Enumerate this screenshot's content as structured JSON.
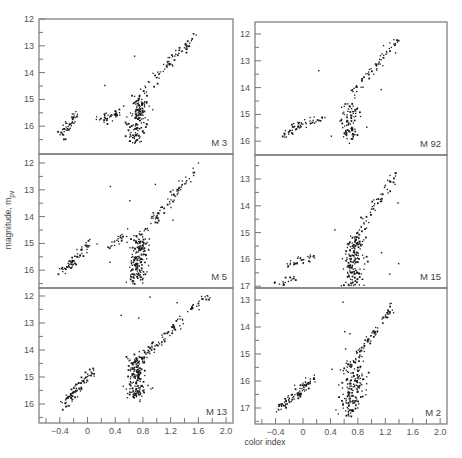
{
  "figure": {
    "ylabel": "magnitude, m_pv",
    "ylabel_main": "magnitude, m",
    "ylabel_sub": "pv",
    "xlabel": "color index",
    "x_ticks": [
      "-0.4",
      "0",
      "0.4",
      "0.8",
      "1.2",
      "1.6",
      "2.0"
    ],
    "colors": {
      "frame": "#777777",
      "points": "#1a1a1a",
      "text": "#555555"
    }
  },
  "chart_data": [
    {
      "type": "scatter",
      "title": "M 3",
      "xlabel": "",
      "ylabel": "magnitude, m_pv",
      "xlim": [
        -0.7,
        2.1
      ],
      "ylim": [
        16.65,
        12
      ],
      "y_ticks": [
        "12",
        "13",
        "14",
        "15",
        "16"
      ],
      "clusters": [
        {
          "region": "horizontal branch (blue)",
          "x": [
            -0.4,
            -0.15
          ],
          "y": [
            16.3,
            15.5
          ],
          "n": 45
        },
        {
          "region": "horizontal branch (red)",
          "x": [
            0.15,
            0.45
          ],
          "y": [
            15.7,
            15.45
          ],
          "n": 35
        },
        {
          "region": "main sequence turnoff/subgiant",
          "x": [
            0.55,
            0.85
          ],
          "y": [
            16.5,
            15.0
          ],
          "n": 150
        },
        {
          "region": "red giant branch",
          "x": [
            0.7,
            1.55
          ],
          "y": [
            15.0,
            12.5
          ],
          "n": 70
        }
      ]
    },
    {
      "type": "scatter",
      "title": "M 92",
      "xlim": [
        -0.7,
        2.1
      ],
      "ylim": [
        16.5,
        11.7
      ],
      "y_ticks": [
        "12",
        "13",
        "14",
        "15",
        "16"
      ],
      "clusters": [
        {
          "region": "horizontal branch (blue)",
          "x": [
            -0.3,
            0.05
          ],
          "y": [
            15.8,
            15.2
          ],
          "n": 45
        },
        {
          "region": "horizontal branch (red)",
          "x": [
            0.1,
            0.35
          ],
          "y": [
            15.2,
            15.1
          ],
          "n": 15
        },
        {
          "region": "main sequence turnoff/subgiant",
          "x": [
            0.5,
            0.8
          ],
          "y": [
            15.9,
            14.5
          ],
          "n": 90
        },
        {
          "region": "red giant branch",
          "x": [
            0.6,
            1.4
          ],
          "y": [
            14.5,
            12.1
          ],
          "n": 60
        }
      ]
    },
    {
      "type": "scatter",
      "title": "M 5",
      "xlim": [
        -0.7,
        2.1
      ],
      "ylim": [
        16.5,
        11.6
      ],
      "y_ticks": [
        "12",
        "13",
        "14",
        "15",
        "16"
      ],
      "clusters": [
        {
          "region": "horizontal branch (blue)",
          "x": [
            -0.35,
            0.05
          ],
          "y": [
            16.0,
            14.9
          ],
          "n": 60
        },
        {
          "region": "horizontal branch (red)",
          "x": [
            0.3,
            0.55
          ],
          "y": [
            15.1,
            14.5
          ],
          "n": 25
        },
        {
          "region": "main sequence turnoff/subgiant",
          "x": [
            0.55,
            0.85
          ],
          "y": [
            16.4,
            14.8
          ],
          "n": 170
        },
        {
          "region": "red giant branch",
          "x": [
            0.7,
            1.6
          ],
          "y": [
            14.8,
            12.1
          ],
          "n": 80
        }
      ]
    },
    {
      "type": "scatter",
      "title": "M 15",
      "xlim": [
        -0.7,
        2.1
      ],
      "ylim": [
        17.2,
        12.2
      ],
      "y_ticks": [
        "13",
        "14",
        "15",
        "16",
        "17"
      ],
      "clusters": [
        {
          "region": "horizontal branch (blue)",
          "x": [
            -0.2,
            0.15
          ],
          "y": [
            16.1,
            15.9
          ],
          "n": 30
        },
        {
          "region": "horizontal branch (blue tail)",
          "x": [
            -0.4,
            -0.1
          ],
          "y": [
            17.1,
            16.5
          ],
          "n": 20
        },
        {
          "region": "main sequence turnoff/subgiant",
          "x": [
            0.55,
            0.85
          ],
          "y": [
            17.1,
            15.2
          ],
          "n": 170
        },
        {
          "region": "red giant branch",
          "x": [
            0.75,
            1.35
          ],
          "y": [
            15.2,
            12.7
          ],
          "n": 60
        }
      ]
    },
    {
      "type": "scatter",
      "title": "M 13",
      "xlim": [
        -0.7,
        2.1
      ],
      "ylim": [
        16.5,
        11.6
      ],
      "y_ticks": [
        "12",
        "13",
        "14",
        "15",
        "16"
      ],
      "clusters": [
        {
          "region": "horizontal branch (blue)",
          "x": [
            -0.35,
            0.05
          ],
          "y": [
            16.0,
            14.7
          ],
          "n": 80
        },
        {
          "region": "main sequence turnoff/subgiant",
          "x": [
            0.5,
            0.85
          ],
          "y": [
            15.8,
            14.2
          ],
          "n": 170
        },
        {
          "region": "red giant branch",
          "x": [
            0.7,
            1.75
          ],
          "y": [
            14.5,
            11.8
          ],
          "n": 90
        }
      ]
    },
    {
      "type": "scatter",
      "title": "M 2",
      "xlim": [
        -0.7,
        2.1
      ],
      "ylim": [
        17.5,
        12.5
      ],
      "y_ticks": [
        "13",
        "14",
        "15",
        "16",
        "17"
      ],
      "clusters": [
        {
          "region": "horizontal branch (blue)",
          "x": [
            -0.35,
            0.15
          ],
          "y": [
            17.0,
            15.9
          ],
          "n": 90
        },
        {
          "region": "main sequence turnoff/subgiant",
          "x": [
            0.45,
            0.9
          ],
          "y": [
            17.3,
            15.2
          ],
          "n": 170
        },
        {
          "region": "red giant branch",
          "x": [
            0.7,
            1.3
          ],
          "y": [
            15.3,
            13.2
          ],
          "n": 70
        }
      ]
    }
  ],
  "panels": [
    {
      "name": "M 3",
      "col": 0,
      "row": 0
    },
    {
      "name": "M 92",
      "col": 1,
      "row": 0
    },
    {
      "name": "M 5",
      "col": 0,
      "row": 1
    },
    {
      "name": "M 15",
      "col": 1,
      "row": 1
    },
    {
      "name": "M 13",
      "col": 0,
      "row": 2
    },
    {
      "name": "M 2",
      "col": 1,
      "row": 2
    }
  ]
}
